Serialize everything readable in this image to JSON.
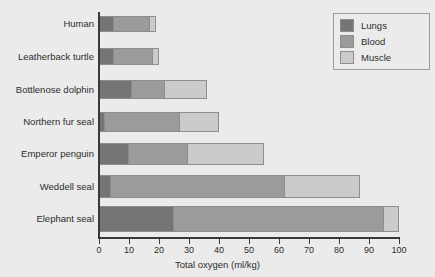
{
  "chart_data": {
    "type": "bar",
    "orientation": "horizontal",
    "stacked": true,
    "title": "",
    "subtitle": "",
    "xlabel": "Total oxygen (ml/kg)",
    "ylabel": "",
    "xlim": [
      0,
      100
    ],
    "xticks": [
      0,
      10,
      20,
      30,
      40,
      50,
      60,
      70,
      80,
      90,
      100
    ],
    "xtick_labels": [
      "0",
      "10",
      "20",
      "30",
      "40",
      "50",
      "60",
      "70",
      "80",
      "90",
      "100"
    ],
    "grid": false,
    "legend_position": "top-right",
    "categories": [
      "Human",
      "Leatherback turtle",
      "Bottlenose dolphin",
      "Northern fur seal",
      "Emperor penguin",
      "Weddell seal",
      "Elephant seal"
    ],
    "series": [
      {
        "name": "Lungs",
        "color": "#757575",
        "values": [
          5,
          5,
          11,
          2,
          10,
          4,
          25
        ]
      },
      {
        "name": "Blood",
        "color": "#9b9b9b",
        "values": [
          12,
          13,
          11,
          25,
          19.5,
          58,
          70
        ]
      },
      {
        "name": "Muscle",
        "color": "#cbcbcb",
        "values": [
          2,
          2,
          14,
          13,
          25.5,
          25,
          5
        ]
      }
    ],
    "totals": [
      19,
      20,
      36,
      40,
      55,
      87,
      100
    ]
  },
  "legend": {
    "items": [
      {
        "label": "Lungs",
        "color": "#757575"
      },
      {
        "label": "Blood",
        "color": "#9b9b9b"
      },
      {
        "label": "Muscle",
        "color": "#cbcbcb"
      }
    ]
  },
  "colors": {
    "background": "#ebebeb",
    "axis": "#3a3a3a",
    "text": "#2b2b2b",
    "bar_outline": "#8d8d8d",
    "lungs": "#757575",
    "blood": "#9b9b9b",
    "muscle": "#cbcbcb"
  }
}
